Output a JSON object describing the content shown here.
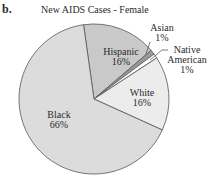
{
  "panel_label": "b.",
  "chart_data": {
    "type": "pie",
    "title": "New AIDS Cases - Female",
    "slices": [
      {
        "label": "Hispanic",
        "value": 16,
        "display": "16%",
        "color": "#c9c9c9"
      },
      {
        "label": "Asian",
        "value": 1,
        "display": "1%",
        "color": "#9a9a9a"
      },
      {
        "label": "Native American",
        "value": 1,
        "display": "1%",
        "color": "#ffffff"
      },
      {
        "label": "White",
        "value": 16,
        "display": "16%",
        "color": "#ececec"
      },
      {
        "label": "Black",
        "value": 66,
        "display": "66%",
        "color": "#dcdcdc"
      }
    ],
    "start_angle_deg": -8,
    "direction": "clockwise"
  },
  "labels": {
    "hispanic": {
      "name": "Hispanic",
      "pct": "16%"
    },
    "asian": {
      "name": "Asian",
      "pct": "1%"
    },
    "native_line1": "Native",
    "native_line2": "American",
    "native_pct": "1%",
    "white": {
      "name": "White",
      "pct": "16%"
    },
    "black": {
      "name": "Black",
      "pct": "66%"
    }
  }
}
